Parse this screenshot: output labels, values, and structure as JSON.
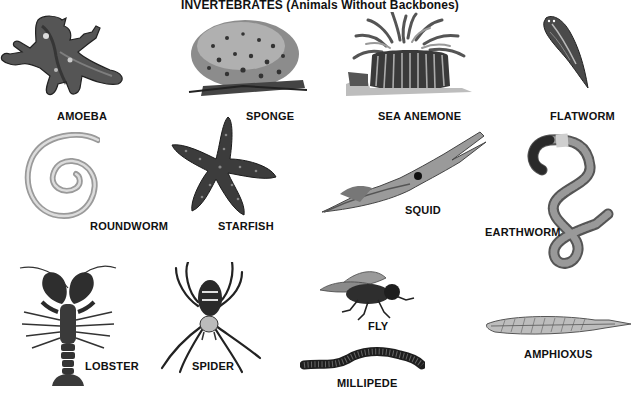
{
  "title": "INVERTEBRATES (Animals Without Backbones)",
  "animals": [
    {
      "id": "amoeba",
      "label": "AMOEBA"
    },
    {
      "id": "sponge",
      "label": "SPONGE"
    },
    {
      "id": "sea-anemone",
      "label": "SEA ANEMONE"
    },
    {
      "id": "flatworm",
      "label": "FLATWORM"
    },
    {
      "id": "roundworm",
      "label": "ROUNDWORM"
    },
    {
      "id": "starfish",
      "label": "STARFISH"
    },
    {
      "id": "squid",
      "label": "SQUID"
    },
    {
      "id": "earthworm",
      "label": "EARTHWORM"
    },
    {
      "id": "lobster",
      "label": "LOBSTER"
    },
    {
      "id": "spider",
      "label": "SPIDER"
    },
    {
      "id": "fly",
      "label": "FLY"
    },
    {
      "id": "millipede",
      "label": "MILLIPEDE"
    },
    {
      "id": "amphioxus",
      "label": "AMPHIOXUS"
    }
  ],
  "colors": {
    "background": "#ffffff",
    "ink": "#111111",
    "dark": "#2a2a2a",
    "mid": "#7a7a7a",
    "light": "#c8c8c8"
  }
}
